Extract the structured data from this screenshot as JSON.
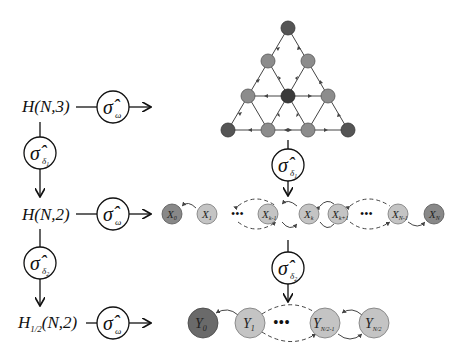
{
  "diagram": {
    "rows": [
      {
        "label": "H(N,3)",
        "operator": "σ̂",
        "operator_sub": "ω"
      },
      {
        "label": "H(N,2)",
        "operator": "σ̂",
        "operator_sub": "ω"
      },
      {
        "label_main": "H",
        "label_sub": "1/2",
        "label_rest": "(N,2)",
        "operator": "σ̂",
        "operator_sub": "ω"
      }
    ],
    "left_reductions": [
      {
        "operator": "σ̂",
        "operator_sub": "δ",
        "operator_subsub": "1"
      },
      {
        "operator": "σ̂",
        "operator_sub": "δ",
        "operator_subsub": "2"
      }
    ],
    "right_reductions": [
      {
        "operator": "σ̂",
        "operator_sub": "δ",
        "operator_subsub": "1"
      },
      {
        "operator": "σ̂",
        "operator_sub": "δ",
        "operator_subsub": "2"
      }
    ],
    "chain_x": [
      {
        "name": "X",
        "sub": "0"
      },
      {
        "name": "X",
        "sub": "1"
      },
      {
        "name": "X",
        "sub": "k-1"
      },
      {
        "name": "X",
        "sub": "k"
      },
      {
        "name": "X",
        "sub": "k+1"
      },
      {
        "name": "X",
        "sub": "N-1"
      },
      {
        "name": "X",
        "sub": "N"
      }
    ],
    "chain_y": [
      {
        "name": "Y",
        "sub": "0"
      },
      {
        "name": "Y",
        "sub": "1"
      },
      {
        "name": "Y",
        "sub": "N/2-1"
      },
      {
        "name": "Y",
        "sub": "N/2"
      }
    ],
    "ellipsis": "•••",
    "colors": {
      "dark_node": "#555555",
      "mid_node": "#8c8c8c",
      "light_node": "#c4c4c4",
      "line": "#222222"
    }
  }
}
